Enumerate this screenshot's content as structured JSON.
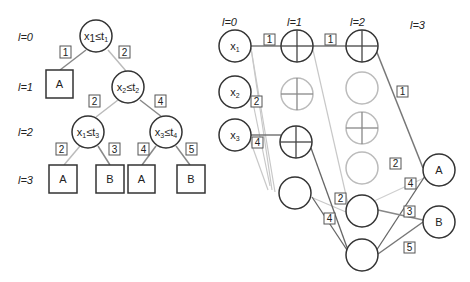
{
  "left_tree": {
    "levels": [
      "l=0",
      "l=1",
      "l=2",
      "l=3"
    ],
    "nodes": {
      "root": {
        "var": "x",
        "vsub": "1",
        "thr": "t",
        "tsub": "1"
      },
      "n1": {
        "var": "x",
        "vsub": "2",
        "thr": "t",
        "tsub": "2"
      },
      "n2": {
        "var": "x",
        "vsub": "1",
        "thr": "t",
        "tsub": "3"
      },
      "n3": {
        "var": "x",
        "vsub": "3",
        "thr": "t",
        "tsub": "4"
      }
    },
    "leaves": [
      "A",
      "A",
      "B",
      "A",
      "B"
    ],
    "edge_labels": [
      "1",
      "2",
      "2",
      "4",
      "2",
      "3",
      "4",
      "5"
    ]
  },
  "network": {
    "levels": [
      "l=0",
      "l=1",
      "l=2",
      "l=3"
    ],
    "inputs": [
      {
        "var": "x",
        "sub": "1"
      },
      {
        "var": "x",
        "sub": "2"
      },
      {
        "var": "x",
        "sub": "3"
      }
    ],
    "outputs": [
      "A",
      "B"
    ],
    "edge_labels": {
      "x1_l1": "1",
      "l1_l2": "1",
      "l2_A": "1",
      "x2": "2",
      "x3": "4",
      "e2_mid": "2",
      "e4_mid": "4",
      "to_A_2": "2",
      "to_A_4": "4",
      "to_B_3": "3",
      "to_B_5": "5"
    }
  },
  "colors": {
    "dark": "#333333",
    "mid": "#777777",
    "light": "#bbbbbb"
  }
}
